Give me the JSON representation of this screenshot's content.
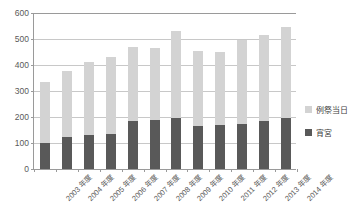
{
  "chart_data": {
    "type": "bar",
    "stacked": true,
    "title": "",
    "xlabel": "",
    "ylabel": "",
    "ylim": [
      0,
      600
    ],
    "yticks": [
      0,
      100,
      200,
      300,
      400,
      500,
      600
    ],
    "ytick_labels": [
      "0",
      "100",
      "200",
      "300",
      "400",
      "500",
      "600"
    ],
    "grid": true,
    "legend_position": "right",
    "categories": [
      "2003 年度",
      "2004 年度",
      "2005 年度",
      "2006 年度",
      "2007 年度",
      "2008 年度",
      "2009 年度",
      "2010 年度",
      "2011 年度",
      "2012 年度",
      "2013 年度",
      "2014 年度"
    ],
    "series": [
      {
        "name": "宵宮",
        "color": "#595959",
        "values": [
          100,
          125,
          130,
          135,
          185,
          190,
          195,
          165,
          170,
          175,
          185,
          195
        ]
      },
      {
        "name": "例祭当日",
        "color": "#d3d3d3",
        "values": [
          235,
          253,
          280,
          295,
          285,
          275,
          335,
          290,
          280,
          320,
          330,
          350
        ]
      }
    ],
    "totals": [
      335,
      378,
      410,
      430,
      470,
      465,
      530,
      455,
      450,
      495,
      515,
      545
    ]
  },
  "legend": {
    "items": [
      {
        "label": "例祭当日",
        "swatch": "light"
      },
      {
        "label": "宵宮",
        "swatch": "dark"
      }
    ]
  },
  "colors": {
    "series_light": "#d3d3d3",
    "series_dark": "#595959",
    "axis": "#9a9a9a",
    "grid": "#c8c8c8",
    "text": "#5a5a5a",
    "background": "#ffffff"
  }
}
